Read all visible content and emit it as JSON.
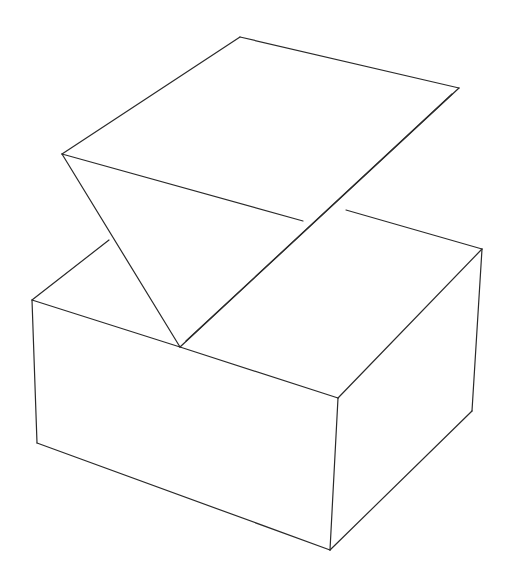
{
  "figure": {
    "stroke_color": "#2a2a2a",
    "background": "#ffffff",
    "shapes": [
      {
        "name": "box",
        "edges": [
          [
            [
              32,
              300
            ],
            [
              180,
              347
            ]
          ],
          [
            [
              180,
              347
            ],
            [
              338,
              398
            ]
          ],
          [
            [
              338,
              398
            ],
            [
              482,
              249
            ]
          ],
          [
            [
              482,
              249
            ],
            [
              346,
              210
            ]
          ],
          [
            [
              32,
              300
            ],
            [
              109,
              240
            ]
          ],
          [
            [
              32,
              300
            ],
            [
              37,
              443
            ]
          ],
          [
            [
              37,
              443
            ],
            [
              330,
              550
            ]
          ],
          [
            [
              338,
              398
            ],
            [
              330,
              550
            ]
          ],
          [
            [
              482,
              249
            ],
            [
              472,
              411
            ]
          ],
          [
            [
              472,
              411
            ],
            [
              330,
              550
            ]
          ]
        ]
      },
      {
        "name": "folded-plane",
        "edges": [
          [
            [
              62,
              154
            ],
            [
              240,
              37
            ]
          ],
          [
            [
              240,
              37
            ],
            [
              459,
              88
            ]
          ],
          [
            [
              62,
              154
            ],
            [
              303,
              221
            ]
          ],
          [
            [
              62,
              154
            ],
            [
              180,
              347
            ]
          ],
          [
            [
              180,
              347
            ],
            [
              459,
              88
            ]
          ],
          [
            [
              186,
              341
            ],
            [
              452,
              94
            ]
          ]
        ]
      }
    ]
  }
}
